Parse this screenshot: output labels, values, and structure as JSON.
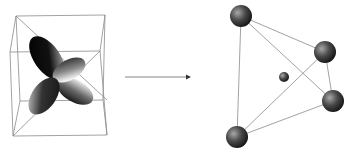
{
  "figure": {
    "left_panel": {
      "label": "",
      "object": "cube-with-four-orbital-lobes",
      "lobe_count": 4
    },
    "arrow": {
      "direction": "right",
      "label": ""
    },
    "right_panel": {
      "label": "",
      "object": "tetrahedron",
      "vertex_sphere_count": 4,
      "center_sphere_count": 1
    },
    "colors": {
      "background": "#ffffff",
      "edge": "#8a8a8a",
      "lobe_dark": "#000000",
      "lobe_light": "#e0e0e0",
      "sphere_dark": "#1a1a1a",
      "sphere_light": "#9a9a9a",
      "arrow": "#555555"
    }
  }
}
